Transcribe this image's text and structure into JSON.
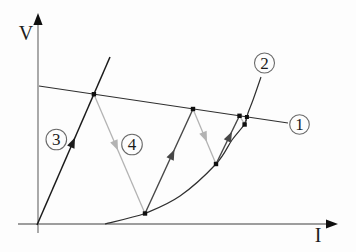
{
  "figure": {
    "y_axis_label": "V",
    "x_axis_label": "I",
    "callouts": [
      {
        "label": "1"
      },
      {
        "label": "2"
      },
      {
        "label": "3"
      },
      {
        "label": "4"
      }
    ],
    "colors": {
      "bg": "#fdfdfd",
      "axis": "#7d7d7d",
      "ink": "#2f2f2f",
      "line3": "#1b1b1b",
      "gray": "#b3b3b3",
      "dark": "#474747",
      "dot": "#0f0f0f",
      "callout-stroke": "#6a6a6a",
      "text": "#1c1c1c"
    }
  }
}
